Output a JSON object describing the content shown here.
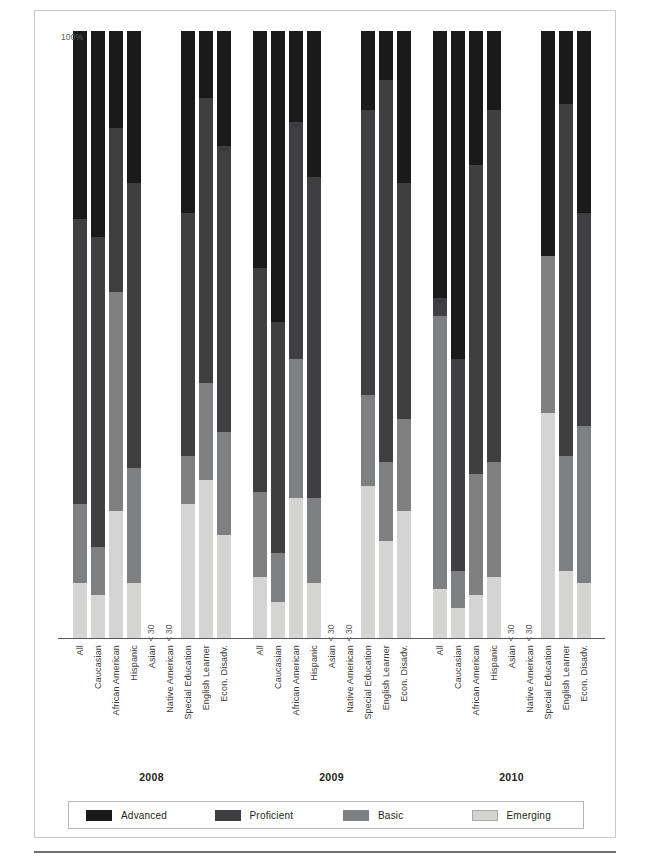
{
  "figure": {
    "y_axis_top_label": "100%",
    "no_data_label": "< 30",
    "groups": [
      "2008",
      "2009",
      "2010"
    ],
    "categories": [
      "All",
      "Caucasian",
      "African American",
      "Hispanic",
      "Asian",
      "Native American",
      "Special Education",
      "English Learner",
      "Econ. Disadv."
    ]
  },
  "legend": {
    "items": [
      {
        "label": "Advanced",
        "color": "#1a1a1a",
        "key": "advanced"
      },
      {
        "label": "Proficient",
        "color": "#3f3f41",
        "key": "proficient"
      },
      {
        "label": "Basic",
        "color": "#7e8082",
        "key": "basic"
      },
      {
        "label": "Emerging",
        "color": "#d4d5d3",
        "key": "emerging"
      }
    ]
  },
  "chart_data": {
    "type": "bar",
    "subtype": "stacked-percent-column",
    "title": "",
    "xlabel": "",
    "ylabel": "",
    "ylim": [
      0,
      100
    ],
    "grid": false,
    "legend_position": "bottom",
    "stack_order_top_to_bottom": [
      "Advanced",
      "Proficient",
      "Basic",
      "Emerging"
    ],
    "series": [
      {
        "name": "Advanced",
        "color": "#1a1a1a"
      },
      {
        "name": "Proficient",
        "color": "#3f3f41"
      },
      {
        "name": "Basic",
        "color": "#7e8082"
      },
      {
        "name": "Emerging",
        "color": "#d4d5d3"
      }
    ],
    "categories": [
      "All",
      "Caucasian",
      "African American",
      "Hispanic",
      "Asian",
      "Native American",
      "Special Education",
      "English Learner",
      "Econ. Disadv."
    ],
    "groups": [
      {
        "year": "2008",
        "bars": [
          {
            "category": "All",
            "no_data": false,
            "advanced": 31,
            "proficient": 47,
            "basic": 13,
            "emerging": 9
          },
          {
            "category": "Caucasian",
            "no_data": false,
            "advanced": 34,
            "proficient": 51,
            "basic": 8,
            "emerging": 7
          },
          {
            "category": "African American",
            "no_data": false,
            "advanced": 16,
            "proficient": 27,
            "basic": 36,
            "emerging": 21
          },
          {
            "category": "Hispanic",
            "no_data": false,
            "advanced": 25,
            "proficient": 47,
            "basic": 19,
            "emerging": 9
          },
          {
            "category": "Asian",
            "no_data": true,
            "advanced": 0,
            "proficient": 0,
            "basic": 0,
            "emerging": 0
          },
          {
            "category": "Native American",
            "no_data": true,
            "advanced": 0,
            "proficient": 0,
            "basic": 0,
            "emerging": 0
          },
          {
            "category": "Special Education",
            "no_data": false,
            "advanced": 30,
            "proficient": 40,
            "basic": 8,
            "emerging": 22
          },
          {
            "category": "English Learner",
            "no_data": false,
            "advanced": 11,
            "proficient": 47,
            "basic": 16,
            "emerging": 26
          },
          {
            "category": "Econ. Disadv.",
            "no_data": false,
            "advanced": 19,
            "proficient": 47,
            "basic": 17,
            "emerging": 17
          }
        ]
      },
      {
        "year": "2009",
        "bars": [
          {
            "category": "All",
            "no_data": false,
            "advanced": 39,
            "proficient": 37,
            "basic": 14,
            "emerging": 10
          },
          {
            "category": "Caucasian",
            "no_data": false,
            "advanced": 48,
            "proficient": 38,
            "basic": 8,
            "emerging": 6
          },
          {
            "category": "African American",
            "no_data": false,
            "advanced": 15,
            "proficient": 39,
            "basic": 23,
            "emerging": 23
          },
          {
            "category": "Hispanic",
            "no_data": false,
            "advanced": 24,
            "proficient": 53,
            "basic": 14,
            "emerging": 9
          },
          {
            "category": "Asian",
            "no_data": true,
            "advanced": 0,
            "proficient": 0,
            "basic": 0,
            "emerging": 0
          },
          {
            "category": "Native American",
            "no_data": true,
            "advanced": 0,
            "proficient": 0,
            "basic": 0,
            "emerging": 0
          },
          {
            "category": "Special Education",
            "no_data": false,
            "advanced": 13,
            "proficient": 47,
            "basic": 15,
            "emerging": 25
          },
          {
            "category": "English Learner",
            "no_data": false,
            "advanced": 8,
            "proficient": 63,
            "basic": 13,
            "emerging": 16
          },
          {
            "category": "Econ. Disadv.",
            "no_data": false,
            "advanced": 25,
            "proficient": 39,
            "basic": 15,
            "emerging": 21
          }
        ]
      },
      {
        "year": "2010",
        "bars": [
          {
            "category": "All",
            "no_data": false,
            "advanced": 44,
            "proficient": 3,
            "basic": 45,
            "emerging": 8
          },
          {
            "category": "Caucasian",
            "no_data": false,
            "advanced": 54,
            "proficient": 35,
            "basic": 6,
            "emerging": 5
          },
          {
            "category": "African American",
            "no_data": false,
            "advanced": 22,
            "proficient": 51,
            "basic": 20,
            "emerging": 7
          },
          {
            "category": "Hispanic",
            "no_data": false,
            "advanced": 13,
            "proficient": 58,
            "basic": 19,
            "emerging": 10
          },
          {
            "category": "Asian",
            "no_data": true,
            "advanced": 0,
            "proficient": 0,
            "basic": 0,
            "emerging": 0
          },
          {
            "category": "Native American",
            "no_data": true,
            "advanced": 0,
            "proficient": 0,
            "basic": 0,
            "emerging": 0
          },
          {
            "category": "Special Education",
            "no_data": false,
            "advanced": 37,
            "proficient": 0,
            "basic": 26,
            "emerging": 37
          },
          {
            "category": "English Learner",
            "no_data": false,
            "advanced": 12,
            "proficient": 58,
            "basic": 19,
            "emerging": 11
          },
          {
            "category": "Econ. Disadv.",
            "no_data": false,
            "advanced": 30,
            "proficient": 35,
            "basic": 26,
            "emerging": 9
          }
        ]
      }
    ]
  }
}
